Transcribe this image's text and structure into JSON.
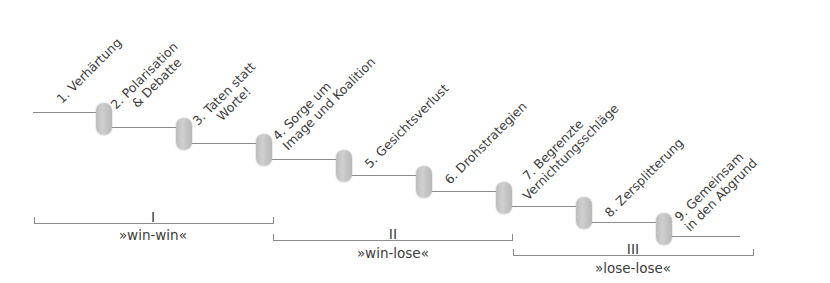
{
  "stages": [
    {
      "number": "1.",
      "lines": [
        "Verhärtung"
      ]
    },
    {
      "number": "2.",
      "lines": [
        "Polarisation",
        "& Debatte"
      ]
    },
    {
      "number": "3.",
      "lines": [
        "Taten statt",
        "Worte!"
      ]
    },
    {
      "number": "4.",
      "lines": [
        "Sorge um",
        "Image und Koalition"
      ]
    },
    {
      "number": "5.",
      "lines": [
        "Gesichtsverlust"
      ]
    },
    {
      "number": "6.",
      "lines": [
        "Drohstrategien"
      ]
    },
    {
      "number": "7.",
      "lines": [
        "Begrenzte",
        "Vernichtungsschläge"
      ]
    },
    {
      "number": "8.",
      "lines": [
        "Zersplitterung"
      ]
    },
    {
      "number": "9.",
      "lines": [
        "Gemeinsam",
        "in den Abgrund"
      ]
    }
  ],
  "stage_text": {
    "s1": {
      "l1": "1. Verhärtung"
    },
    "s2": {
      "l1": "2. Polarisation",
      "l2": "& Debatte"
    },
    "s3": {
      "l1": "3. Taten statt",
      "l2": "Worte!"
    },
    "s4": {
      "l1": "4. Sorge um",
      "l2": "Image und Koalition"
    },
    "s5": {
      "l1": "5. Gesichtsverlust"
    },
    "s6": {
      "l1": "6. Drohstrategien"
    },
    "s7": {
      "l1": "7. Begrenzte",
      "l2": "Vernichtungsschläge"
    },
    "s8": {
      "l1": "8. Zersplitterung"
    },
    "s9": {
      "l1": "9. Gemeinsam",
      "l2": "in den Abgrund"
    }
  },
  "phases": [
    {
      "roman": "I",
      "label": "»win-win«"
    },
    {
      "roman": "II",
      "label": "»win-lose«"
    },
    {
      "roman": "III",
      "label": "»lose-lose«"
    }
  ],
  "colors": {
    "line": "#8c8c8c",
    "pill": "#c4c4c4",
    "text": "#3c3c3c"
  }
}
